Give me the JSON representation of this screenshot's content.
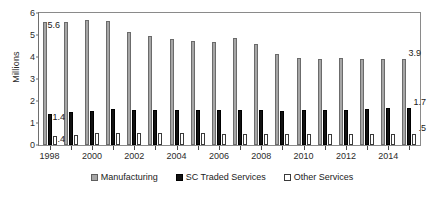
{
  "chart_data": {
    "type": "bar",
    "title": "",
    "xlabel": "",
    "ylabel": "Millions",
    "ylim": [
      0,
      6
    ],
    "yticks": [
      0,
      1,
      2,
      3,
      4,
      5,
      6
    ],
    "grid": false,
    "legend_position": "bottom",
    "categories": [
      "1998",
      "1999",
      "2000",
      "2001",
      "2002",
      "2003",
      "2004",
      "2005",
      "2006",
      "2007",
      "2008",
      "2009",
      "2010",
      "2011",
      "2012",
      "2013",
      "2014",
      "2015"
    ],
    "tick_labels": [
      "1998",
      "2000",
      "2002",
      "2004",
      "2006",
      "2008",
      "2010",
      "2012",
      "2014"
    ],
    "series": [
      {
        "name": "Manufacturing",
        "color": "#a6a6a6",
        "values": [
          5.6,
          5.6,
          5.7,
          5.65,
          5.15,
          4.95,
          4.8,
          4.75,
          4.7,
          4.85,
          4.6,
          4.15,
          3.95,
          3.9,
          3.95,
          3.9,
          3.9,
          3.9
        ]
      },
      {
        "name": "SC Traded Services",
        "color": "#121212",
        "values": [
          1.4,
          1.5,
          1.55,
          1.65,
          1.6,
          1.6,
          1.6,
          1.6,
          1.6,
          1.6,
          1.6,
          1.55,
          1.6,
          1.6,
          1.6,
          1.65,
          1.7,
          1.7
        ]
      },
      {
        "name": "Other Services",
        "color": "#ffffff",
        "values": [
          0.4,
          0.45,
          0.55,
          0.55,
          0.55,
          0.55,
          0.55,
          0.55,
          0.5,
          0.5,
          0.5,
          0.5,
          0.5,
          0.5,
          0.5,
          0.5,
          0.5,
          0.5
        ]
      }
    ],
    "data_labels": [
      {
        "text": "5.6",
        "group": 0,
        "series": 0
      },
      {
        "text": "1.4",
        "group": 0,
        "series": 1
      },
      {
        "text": ".4",
        "group": 0,
        "series": 2
      },
      {
        "text": "3.9",
        "group": 17,
        "series": 0
      },
      {
        "text": "1.7",
        "group": 17,
        "series": 1
      },
      {
        "text": ".5",
        "group": 17,
        "series": 2
      }
    ]
  },
  "legend": {
    "items": [
      {
        "label": "Manufacturing"
      },
      {
        "label": "SC Traded Services"
      },
      {
        "label": "Other Services"
      }
    ]
  }
}
